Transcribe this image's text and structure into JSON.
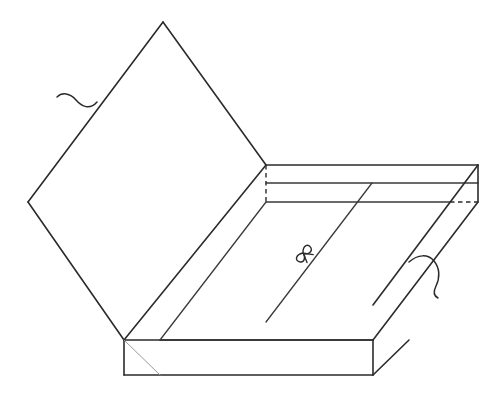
{
  "figure": {
    "background_color": "#ffffff",
    "line_color": "#2b2b2b",
    "faint_line_color": "#9a9a9a",
    "canvas": {
      "width": 502,
      "height": 401
    },
    "parts": {
      "lid": {
        "name": "lid-panel",
        "shape": "diamond",
        "points": "163,22 266,165 124,340 28,202",
        "vertices": {
          "top": "163,22",
          "right": "266,165",
          "bottom": "124,340",
          "left": "28,202"
        }
      },
      "box_top_rim_outer": {
        "name": "box-top-rim",
        "points": "266,165 478,165 478,202 266,202"
      },
      "back_wall": {
        "name": "box-back-wall",
        "top_edge": "266,165 478,165",
        "mid_edge": "266,183 478,183",
        "bottom_edge": "266,202 478,202"
      },
      "interior_floor": {
        "name": "box-interior-floor",
        "points": "266,202 478,202 373,340 160,340"
      },
      "front_wall": {
        "name": "box-front-wall",
        "points": "124,340 373,340 373,375 124,375"
      },
      "right_wall": {
        "name": "box-right-wall",
        "points": "478,165 478,202 373,340 373,305"
      },
      "hidden_lines": {
        "name": "hidden-edges",
        "back_left_vertical": "266,165 266,202",
        "right_inner_horizontal": "450,202 478,202"
      },
      "interior_diagonals": [
        {
          "name": "interior-diagonal-left",
          "from": "266,202",
          "to": "160,340"
        },
        {
          "name": "interior-diagonal-right",
          "from": "372,183",
          "to": "266,322"
        },
        {
          "name": "front-face-faint-diagonal",
          "from": "124,340",
          "to": "160,375"
        }
      ],
      "bow_marker": {
        "name": "bow-knot-marker",
        "position": "303,253",
        "symbol": "ribbon-bow"
      },
      "leaders": [
        {
          "name": "leader-line-lid",
          "target": "97,102",
          "description": "wavy leader pointing at lid edge, extends left"
        },
        {
          "name": "leader-line-box",
          "target": "409,262",
          "description": "wavy leader pointing at box right wall, extends right and down"
        }
      ]
    }
  }
}
